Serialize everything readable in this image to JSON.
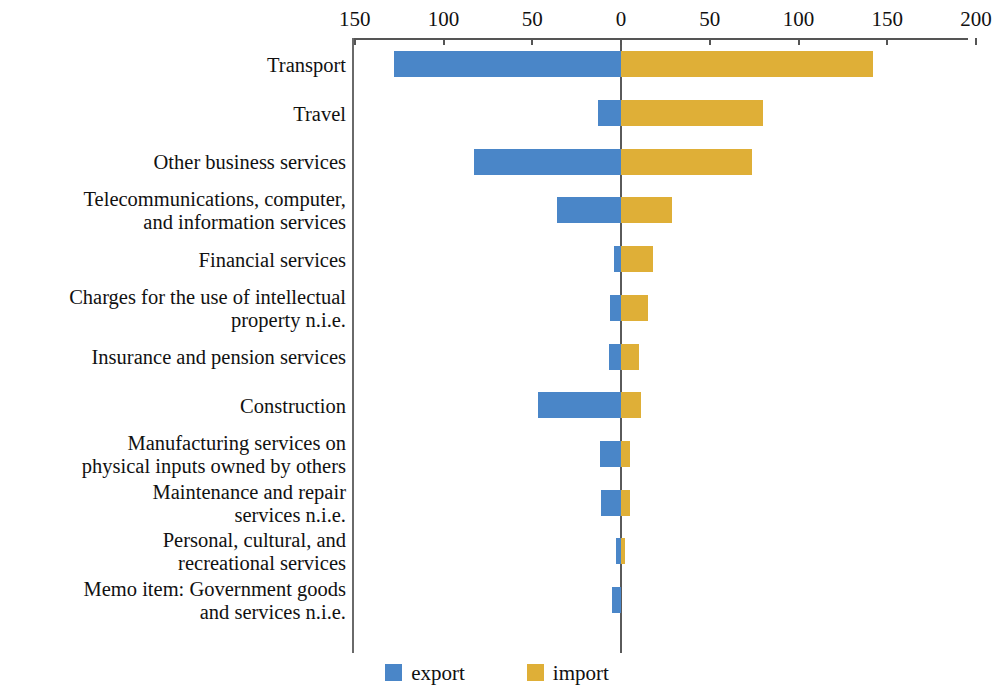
{
  "chart_data": {
    "type": "bar",
    "orientation": "horizontal",
    "style": "diverging-bidirectional",
    "title": "",
    "subtitle": "",
    "xlabel": "",
    "ylabel": "",
    "grid": false,
    "axis": {
      "position": "top",
      "zero_at": 0,
      "tick_labels": [
        "150",
        "100",
        "50",
        "0",
        "50",
        "100",
        "150",
        "200"
      ],
      "tick_values": [
        -150,
        -100,
        -50,
        0,
        50,
        100,
        150,
        200
      ],
      "xlim": [
        -155,
        200
      ],
      "note": "left side of zero shows export magnitudes, right side shows import magnitudes; both axes labelled with positive numbers"
    },
    "legend": {
      "position": "bottom-center",
      "entries": [
        {
          "name": "export",
          "color": "#4a86c8"
        },
        {
          "name": "import",
          "color": "#dfaf37"
        }
      ]
    },
    "categories": [
      "Transport",
      "Travel",
      "Other business services",
      "Telecommunications, computer,\nand information services",
      "Financial services",
      "Charges for the use of intellectual\nproperty n.i.e.",
      "Insurance and pension services",
      "Construction",
      "Manufacturing services on\nphysical inputs owned by others",
      "Maintenance and repair\nservices n.i.e.",
      "Personal, cultural, and\nrecreational services",
      "Memo item: Government goods\nand services n.i.e."
    ],
    "series": [
      {
        "name": "export",
        "color": "#4a86c8",
        "direction": "left",
        "values": [
          128,
          13,
          83,
          36,
          4,
          6,
          7,
          47,
          12,
          11,
          3,
          5
        ]
      },
      {
        "name": "import",
        "color": "#dfaf37",
        "direction": "right",
        "values": [
          142,
          80,
          74,
          29,
          18,
          15,
          10,
          11,
          5,
          5,
          2,
          0
        ]
      }
    ]
  },
  "colors": {
    "export": "#4a86c8",
    "import": "#dfaf37",
    "axis": "#5a5a5a",
    "text": "#111111",
    "background": "#ffffff"
  }
}
